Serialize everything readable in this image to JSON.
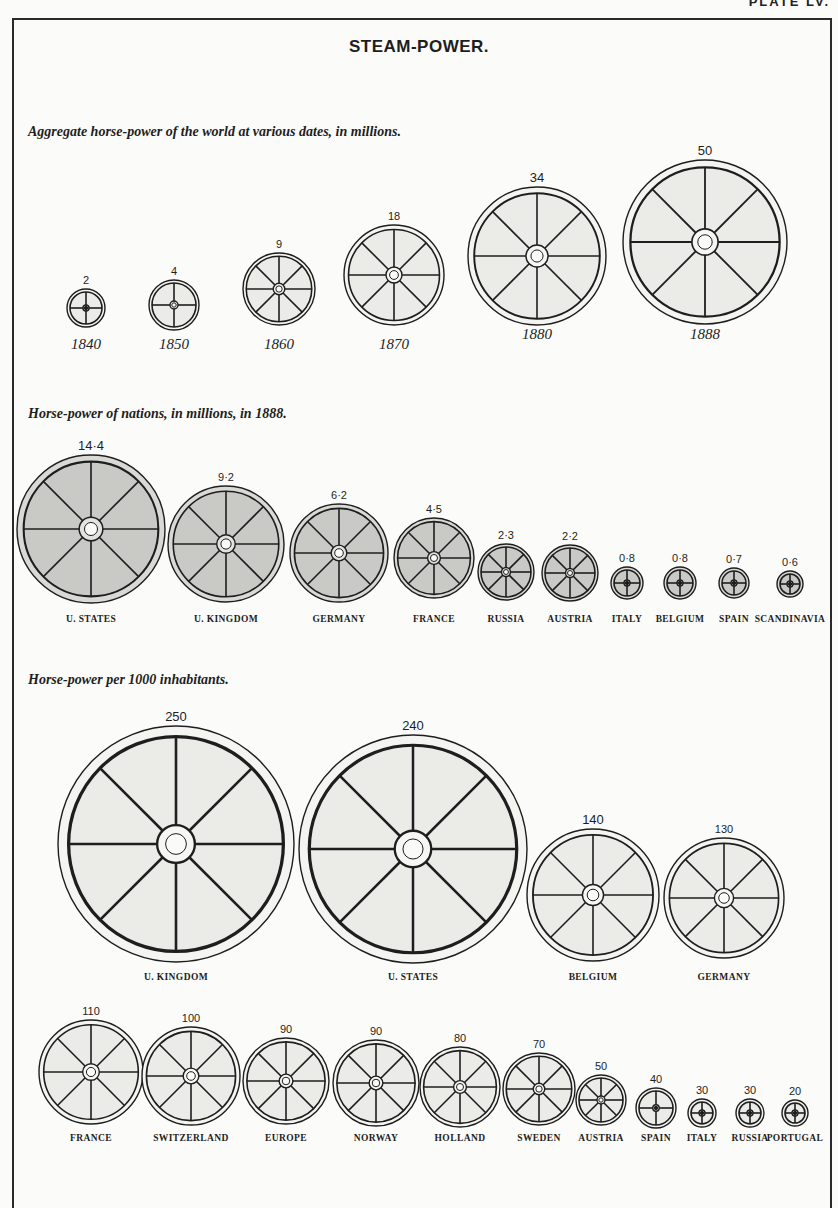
{
  "page": {
    "plate_label": "PLATE LV.",
    "title": "STEAM-POWER."
  },
  "sections": [
    {
      "id": "world",
      "title": "Aggregate horse-power of the world at various dates, in millions."
    },
    {
      "id": "nations",
      "title": "Horse-power of nations, in millions, in 1888."
    },
    {
      "id": "per_capita",
      "title": "Horse-power per 1000 inhabitants."
    }
  ],
  "colors": {
    "ink": "#1e1e1e",
    "paper": "#fbfbf9",
    "wheel_fill_light": "#ebebe8",
    "wheel_fill_shaded": "#c9c9c6",
    "rim_light": "#f4f4f1",
    "rim_shaded": "#d9d9d6"
  },
  "chart_data": [
    {
      "type": "pictogram",
      "title": "Aggregate horse-power of the world at various dates, in millions.",
      "unit": "millions of horse-power",
      "categories": [
        "1840",
        "1850",
        "1860",
        "1870",
        "1880",
        "1888"
      ],
      "values": [
        2,
        4,
        9,
        18,
        34,
        50
      ],
      "value_labels": [
        "2",
        "4",
        "9",
        "18",
        "34",
        "50"
      ],
      "layout": [
        {
          "cx": 86,
          "cy": 308,
          "r": 19,
          "spokes": 4,
          "label_y": 349
        },
        {
          "cx": 174,
          "cy": 305,
          "r": 25,
          "spokes": 4,
          "label_y": 349
        },
        {
          "cx": 279,
          "cy": 289,
          "r": 36,
          "spokes": 8,
          "label_y": 349
        },
        {
          "cx": 394,
          "cy": 275,
          "r": 50,
          "spokes": 8,
          "label_y": 349
        },
        {
          "cx": 537,
          "cy": 256,
          "r": 69,
          "spokes": 8,
          "label_y": 339
        },
        {
          "cx": 705,
          "cy": 242,
          "r": 82,
          "spokes": 8,
          "label_y": 339
        }
      ],
      "shading": "light"
    },
    {
      "type": "pictogram",
      "title": "Horse-power of nations, in millions, in 1888.",
      "unit": "millions of horse-power",
      "categories": [
        "U. States",
        "U. Kingdom",
        "Germany",
        "France",
        "Russia",
        "Austria",
        "Italy",
        "Belgium",
        "Spain",
        "Scandinavia"
      ],
      "values": [
        14.4,
        9.2,
        6.2,
        4.5,
        2.3,
        2.2,
        0.8,
        0.8,
        0.7,
        0.6
      ],
      "value_labels": [
        "14·4",
        "9·2",
        "6·2",
        "4·5",
        "2·3",
        "2·2",
        "0·8",
        "0·8",
        "0·7",
        "0·6"
      ],
      "layout": [
        {
          "cx": 91,
          "cy": 529,
          "r": 74,
          "spokes": 8
        },
        {
          "cx": 226,
          "cy": 544,
          "r": 58,
          "spokes": 8
        },
        {
          "cx": 339,
          "cy": 553,
          "r": 49,
          "spokes": 8
        },
        {
          "cx": 434,
          "cy": 558,
          "r": 40,
          "spokes": 8
        },
        {
          "cx": 506,
          "cy": 572,
          "r": 28,
          "spokes": 8
        },
        {
          "cx": 570,
          "cy": 573,
          "r": 28,
          "spokes": 8
        },
        {
          "cx": 627,
          "cy": 583,
          "r": 16,
          "spokes": 4
        },
        {
          "cx": 680,
          "cy": 583,
          "r": 16,
          "spokes": 4
        },
        {
          "cx": 734,
          "cy": 583,
          "r": 15,
          "spokes": 4
        },
        {
          "cx": 790,
          "cy": 584,
          "r": 13,
          "spokes": 4
        }
      ],
      "label_y": 622,
      "shading": "shaded"
    },
    {
      "type": "pictogram",
      "title": "Horse-power per 1000 inhabitants.",
      "unit": "horse-power per 1000 inhabitants",
      "categories": [
        "U. Kingdom",
        "U. States",
        "Belgium",
        "Germany",
        "France",
        "Switzerland",
        "Europe",
        "Norway",
        "Holland",
        "Sweden",
        "Austria",
        "Spain",
        "Italy",
        "Russia",
        "Portugal"
      ],
      "values": [
        250,
        240,
        140,
        130,
        110,
        100,
        90,
        90,
        80,
        70,
        50,
        40,
        30,
        30,
        20
      ],
      "value_labels": [
        "250",
        "240",
        "140",
        "130",
        "110",
        "100",
        "90",
        "90",
        "80",
        "70",
        "50",
        "40",
        "30",
        "30",
        "20"
      ],
      "layout": [
        {
          "cx": 176,
          "cy": 844,
          "r": 118,
          "spokes": 8,
          "label_y": 980
        },
        {
          "cx": 413,
          "cy": 849,
          "r": 114,
          "spokes": 8,
          "label_y": 980
        },
        {
          "cx": 593,
          "cy": 895,
          "r": 66,
          "spokes": 8,
          "label_y": 980
        },
        {
          "cx": 724,
          "cy": 898,
          "r": 60,
          "spokes": 8,
          "label_y": 980
        },
        {
          "cx": 91,
          "cy": 1072,
          "r": 52,
          "spokes": 8,
          "label_y": 1141
        },
        {
          "cx": 191,
          "cy": 1076,
          "r": 49,
          "spokes": 8,
          "label_y": 1141
        },
        {
          "cx": 286,
          "cy": 1081,
          "r": 43,
          "spokes": 8,
          "label_y": 1141
        },
        {
          "cx": 376,
          "cy": 1083,
          "r": 43,
          "spokes": 8,
          "label_y": 1141
        },
        {
          "cx": 460,
          "cy": 1087,
          "r": 40,
          "spokes": 8,
          "label_y": 1141
        },
        {
          "cx": 539,
          "cy": 1089,
          "r": 36,
          "spokes": 8,
          "label_y": 1141
        },
        {
          "cx": 601,
          "cy": 1100,
          "r": 25,
          "spokes": 8,
          "label_y": 1141
        },
        {
          "cx": 656,
          "cy": 1108,
          "r": 20,
          "spokes": 4,
          "label_y": 1141
        },
        {
          "cx": 702,
          "cy": 1113,
          "r": 14,
          "spokes": 4,
          "label_y": 1141
        },
        {
          "cx": 750,
          "cy": 1113,
          "r": 14,
          "spokes": 4,
          "label_y": 1141
        },
        {
          "cx": 795,
          "cy": 1113,
          "r": 13,
          "spokes": 4,
          "label_y": 1141
        }
      ],
      "shading": "light"
    }
  ]
}
